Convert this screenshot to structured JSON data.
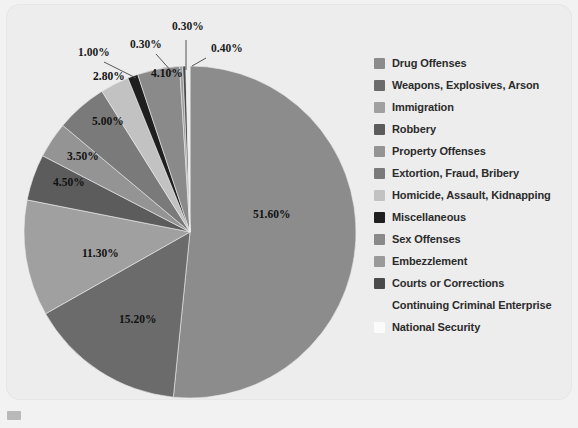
{
  "figure": {
    "background_color": "#f2f2f2",
    "plate_color": "#ededed",
    "label_suffix": "%"
  },
  "legend": {
    "position": "right",
    "items": [
      {
        "label": "Drug Offenses",
        "color": "#8c8c8c"
      },
      {
        "label": "Weapons, Explosives, Arson",
        "color": "#6b6b6b"
      },
      {
        "label": "Immigration",
        "color": "#a0a0a0"
      },
      {
        "label": "Robbery",
        "color": "#5c5c5c"
      },
      {
        "label": "Property Offenses",
        "color": "#949494"
      },
      {
        "label": "Extortion, Fraud, Bribery",
        "color": "#7a7a7a"
      },
      {
        "label": "Homicide, Assault, Kidnapping",
        "color": "#c2c2c2"
      },
      {
        "label": "Miscellaneous",
        "color": "#1f1f1f"
      },
      {
        "label": "Sex Offenses",
        "color": "#8a8a8a"
      },
      {
        "label": "Embezzlement",
        "color": "#9a9a9a"
      },
      {
        "label": "Courts or Corrections",
        "color": "#4a4a4a"
      },
      {
        "label": "Continuing Criminal Enterprise",
        "color": "#ededed"
      },
      {
        "label": "National Security",
        "color": "#fbfbfb"
      }
    ]
  },
  "chart_data": {
    "type": "pie",
    "title": "",
    "xlabel": "",
    "ylabel": "",
    "units": "percent",
    "start_angle_deg": 0,
    "direction": "clockwise",
    "categories": [
      "Drug Offenses",
      "Weapons, Explosives, Arson",
      "Immigration",
      "Robbery",
      "Property Offenses",
      "Extortion, Fraud, Bribery",
      "Homicide, Assault, Kidnapping",
      "Miscellaneous",
      "Sex Offenses",
      "Embezzlement",
      "Courts or Corrections",
      "Continuing Criminal Enterprise",
      "National Security"
    ],
    "values": [
      51.6,
      15.2,
      11.3,
      4.5,
      3.5,
      5.0,
      2.8,
      1.0,
      4.1,
      0.3,
      0.3,
      0.4,
      0.0
    ],
    "data_labels": [
      "51.60%",
      "15.20%",
      "11.30%",
      "4.50%",
      "3.50%",
      "5.00%",
      "2.80%",
      "1.00%",
      "4.10%",
      "0.30%",
      "0.30%",
      "0.40%",
      ""
    ],
    "colors": [
      "#8c8c8c",
      "#6b6b6b",
      "#a0a0a0",
      "#5c5c5c",
      "#949494",
      "#7a7a7a",
      "#c2c2c2",
      "#1f1f1f",
      "#8a8a8a",
      "#9a9a9a",
      "#4a4a4a",
      "#ededed",
      "#fbfbfb"
    ],
    "legend": [
      "Drug Offenses",
      "Weapons, Explosives, Arson",
      "Immigration",
      "Robbery",
      "Property Offenses",
      "Extortion, Fraud, Bribery",
      "Homicide, Assault, Kidnapping",
      "Miscellaneous",
      "Sex Offenses",
      "Embezzlement",
      "Courts or Corrections",
      "Continuing Criminal Enterprise",
      "National Security"
    ],
    "geometry": {
      "center_x": 190,
      "center_y": 232,
      "radius": 166
    },
    "callout_labels": [
      {
        "text": "1.00%",
        "x": 78,
        "y": 56
      },
      {
        "text": "0.30%",
        "x": 130,
        "y": 48
      },
      {
        "text": "0.30%",
        "x": 172,
        "y": 30
      },
      {
        "text": "0.40%",
        "x": 211,
        "y": 52
      }
    ],
    "inner_labels": [
      {
        "text": "51.60%",
        "x": 253,
        "y": 218
      },
      {
        "text": "15.20%",
        "x": 119,
        "y": 323
      },
      {
        "text": "11.30%",
        "x": 82,
        "y": 257
      },
      {
        "text": "4.50%",
        "x": 53,
        "y": 186
      },
      {
        "text": "3.50%",
        "x": 67,
        "y": 160
      },
      {
        "text": "5.00%",
        "x": 92,
        "y": 125
      },
      {
        "text": "2.80%",
        "x": 93,
        "y": 80
      },
      {
        "text": "4.10%",
        "x": 151,
        "y": 77
      }
    ]
  }
}
